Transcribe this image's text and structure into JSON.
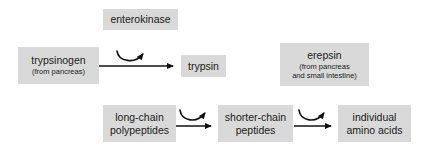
{
  "diagram": {
    "background_color": "#ffffff",
    "box_fill_color": "#d9d9d9",
    "text_color": "#1a1a1a",
    "arrow_color": "#111111",
    "nodes": {
      "enterokinase": {
        "label": "enterokinase"
      },
      "trypsinogen": {
        "label": "trypsinogen",
        "sub": "(from pancreas)"
      },
      "trypsin": {
        "label": "trypsin"
      },
      "erepsin": {
        "label": "erepsin",
        "sub_line1": "(from pancreas",
        "sub_line2": "and small intestine)"
      },
      "long_chain_polypeptides": {
        "line1": "long-chain",
        "line2": "polypeptides"
      },
      "shorter_chain_peptides": {
        "line1": "shorter-chain",
        "line2": "peptides"
      },
      "individual_amino_acids": {
        "line1": "individual",
        "line2": "amino acids"
      }
    },
    "reactions": [
      {
        "from": "trypsinogen",
        "to": "trypsin",
        "catalyst": "enterokinase"
      },
      {
        "from": "long_chain_polypeptides",
        "to": "shorter_chain_peptides",
        "catalyst": "trypsin"
      },
      {
        "from": "shorter_chain_peptides",
        "to": "individual_amino_acids",
        "catalyst": "erepsin"
      }
    ]
  }
}
